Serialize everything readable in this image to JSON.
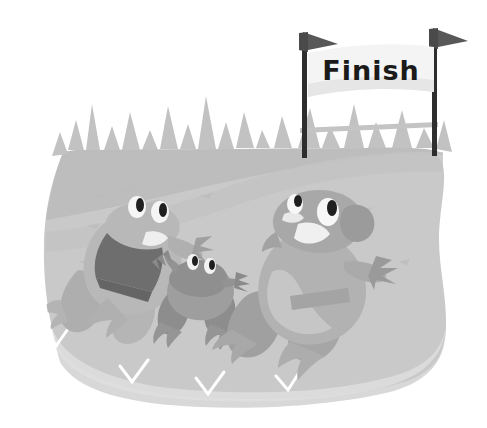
{
  "illustration": {
    "title": "Frog race toward the finish line",
    "subject": "three cartoon frogs racing on a grassy mound",
    "background_color": "#ffffff"
  },
  "banner": {
    "text": "Finish",
    "text_color": "#1a1a1a",
    "banner_color": "#f4f4f4",
    "banner_shadow_color": "#e2e2e2"
  },
  "poles": {
    "count": 2,
    "color": "#2e2e2e",
    "crossbar_color": "#c4c4c4",
    "left_label": "left-finish-pole",
    "right_label": "right-finish-pole"
  },
  "flags": {
    "count": 2,
    "color": "#555555",
    "shape": "pennant"
  },
  "ground": {
    "mound_color": "#c9c9c9",
    "mound_shade_color": "#bdbdbd",
    "mound_base_color": "#d8d8d8",
    "grass_color": "#c2c2c2",
    "grass_blade_count": 17
  },
  "frogs": [
    {
      "id": "frog-left",
      "name": "left frog with dark shirt",
      "body_color": "#b8b8b8",
      "body_shade_color": "#a8a8a8",
      "shirt_color": "#6e6e6e",
      "eye_white_color": "#f5f5f5",
      "pupil_color": "#1f1f1f",
      "mouth_color": "#efefef",
      "position": "left"
    },
    {
      "id": "frog-small",
      "name": "small frog in the middle",
      "body_color": "#9e9e9e",
      "body_shade_color": "#8d8d8d",
      "eye_white_color": "#f2f2f2",
      "pupil_color": "#1f1f1f",
      "position": "center"
    },
    {
      "id": "frog-right",
      "name": "large right frog leading the race",
      "body_color": "#b2b2b2",
      "body_shade_color": "#a0a0a0",
      "belly_color": "#c6c6c6",
      "eye_white_color": "#f7f7f7",
      "pupil_color": "#1f1f1f",
      "mouth_color": "#f0f0f0",
      "position": "right"
    }
  ]
}
